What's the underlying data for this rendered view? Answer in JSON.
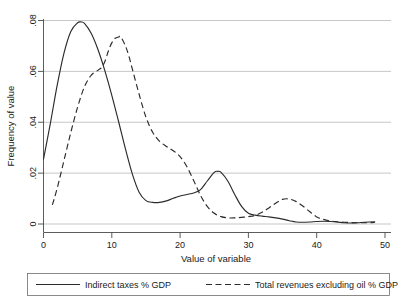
{
  "chart_data": {
    "type": "line",
    "title": "",
    "subtitle": "",
    "xlabel": "Value of variable",
    "ylabel": "Frequency of value",
    "xlim": [
      0,
      50
    ],
    "ylim": [
      0,
      0.08
    ],
    "grid": "horizontal",
    "legend_position": "bottom",
    "xticks": [
      0,
      10,
      20,
      30,
      40,
      50
    ],
    "xtick_labels": [
      "0",
      "10",
      "20",
      "30",
      "40",
      "50"
    ],
    "yticks": [
      0,
      0.02,
      0.04,
      0.06,
      0.08
    ],
    "ytick_labels": [
      "0",
      ".02",
      ".04",
      ".06",
      ".08"
    ],
    "series": [
      {
        "name": "Indirect taxes % GDP",
        "style": "solid",
        "color": "#2b2b2b",
        "x": [
          0,
          1,
          2,
          3,
          4,
          5,
          5.5,
          6,
          7,
          8,
          9,
          10,
          11,
          12,
          13,
          14,
          15,
          16,
          17,
          18,
          19,
          20,
          21,
          22,
          23,
          24,
          25,
          25.5,
          26,
          27,
          28,
          29,
          30,
          31,
          32,
          33,
          34,
          35,
          36,
          37,
          38,
          39,
          40,
          41,
          42,
          43,
          44,
          45,
          46,
          47,
          48.5
        ],
        "y": [
          0.0255,
          0.0395,
          0.0545,
          0.0672,
          0.0757,
          0.0791,
          0.0794,
          0.0789,
          0.0749,
          0.0684,
          0.0601,
          0.0506,
          0.0402,
          0.0295,
          0.0197,
          0.0125,
          0.0092,
          0.0085,
          0.0085,
          0.0091,
          0.0101,
          0.011,
          0.0116,
          0.0122,
          0.0135,
          0.017,
          0.0203,
          0.0207,
          0.0203,
          0.0168,
          0.0116,
          0.0069,
          0.0042,
          0.0035,
          0.0031,
          0.0028,
          0.0024,
          0.0019,
          0.0013,
          0.0008,
          0.0007,
          0.0008,
          0.001,
          0.0011,
          0.001,
          0.0008,
          0.0005,
          0.0004,
          0.0005,
          0.0007,
          0.0009
        ]
      },
      {
        "name": "Total revenues excluding oil % GDP",
        "style": "dashed",
        "color": "#2b2b2b",
        "x": [
          1.3,
          2,
          3,
          4,
          5,
          6,
          7,
          8,
          8.5,
          9,
          9.5,
          10,
          10.5,
          11,
          11.3,
          12,
          12.5,
          13,
          14,
          15,
          16,
          17,
          18,
          19,
          20,
          21,
          22,
          23,
          24,
          25,
          26,
          27,
          28,
          29,
          30,
          31,
          32,
          33,
          34,
          35,
          36,
          37,
          38,
          39,
          40,
          41,
          42,
          43,
          44,
          45,
          46,
          47,
          48.5
        ],
        "y": [
          0.0075,
          0.014,
          0.025,
          0.036,
          0.046,
          0.054,
          0.0585,
          0.0605,
          0.0615,
          0.064,
          0.068,
          0.0712,
          0.073,
          0.0735,
          0.0736,
          0.07,
          0.066,
          0.061,
          0.051,
          0.042,
          0.036,
          0.0325,
          0.0305,
          0.0288,
          0.0265,
          0.0225,
          0.017,
          0.0112,
          0.0068,
          0.0042,
          0.0029,
          0.0024,
          0.0024,
          0.0026,
          0.0029,
          0.0034,
          0.0046,
          0.0063,
          0.0082,
          0.0097,
          0.0098,
          0.0088,
          0.007,
          0.0048,
          0.0028,
          0.0018,
          0.0012,
          0.0009,
          0.0007,
          0.0006,
          0.0005,
          0.0005,
          0.0006
        ]
      }
    ]
  },
  "axes": {
    "x_title": "Value of variable",
    "y_title": "Frequency of value"
  },
  "legend": {
    "entries": [
      {
        "label": "Indirect taxes % GDP",
        "style": "solid"
      },
      {
        "label": "Total revenues excluding oil % GDP",
        "style": "dashed"
      }
    ]
  }
}
